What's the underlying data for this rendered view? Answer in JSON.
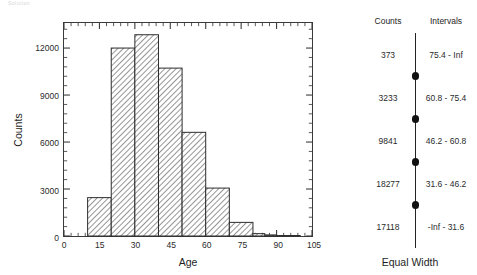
{
  "artifact": {
    "text": "Solution"
  },
  "histogram_panel": {
    "y_axis_title": "Counts",
    "x_axis_title": "Age"
  },
  "bins_panel": {
    "header_counts": "Counts",
    "header_intervals": "Intervals",
    "method_label": "Equal Width",
    "rows": [
      {
        "count": "373",
        "interval": "75.4 - Inf"
      },
      {
        "count": "3233",
        "interval": "60.8 - 75.4"
      },
      {
        "count": "9841",
        "interval": "46.2 - 60.8"
      },
      {
        "count": "18277",
        "interval": "31.6 - 46.2"
      },
      {
        "count": "17118",
        "interval": "-Inf - 31.6"
      }
    ],
    "boundaries": [
      "75.4",
      "60.8",
      "46.2",
      "31.6"
    ]
  },
  "chart_data": {
    "type": "bar",
    "title": "",
    "xlabel": "Age",
    "ylabel": "Counts",
    "xlim": [
      0,
      105
    ],
    "ylim": [
      0,
      13600
    ],
    "grid": false,
    "legend": null,
    "xticks": [
      0,
      15,
      30,
      45,
      60,
      75,
      90,
      105
    ],
    "xtick_labels": [
      "0",
      "15",
      "30",
      "45",
      "60",
      "75",
      "90",
      "105"
    ],
    "yticks": [
      0,
      3000,
      6000,
      9000,
      12000
    ],
    "ytick_labels": [
      "0",
      "3000",
      "6000",
      "9000",
      "12000"
    ],
    "xminor_interval": 3,
    "yminor_interval": 600,
    "bin_width": 10,
    "bar_style": "diagonal-hatch",
    "bar_edge_color": "#2b2b2b",
    "bins": [
      {
        "x0": 10,
        "x1": 20,
        "value": 2450
      },
      {
        "x0": 20,
        "x1": 30,
        "value": 12000
      },
      {
        "x0": 30,
        "x1": 40,
        "value": 12850
      },
      {
        "x0": 40,
        "x1": 50,
        "value": 10720
      },
      {
        "x0": 50,
        "x1": 60,
        "value": 6620
      },
      {
        "x0": 60,
        "x1": 70,
        "value": 3060
      },
      {
        "x0": 70,
        "x1": 80,
        "value": 870
      },
      {
        "x0": 80,
        "x1": 85,
        "value": 150
      },
      {
        "x0": 85,
        "x1": 90,
        "value": 70
      },
      {
        "x0": 90,
        "x1": 100,
        "value": 30
      }
    ]
  }
}
